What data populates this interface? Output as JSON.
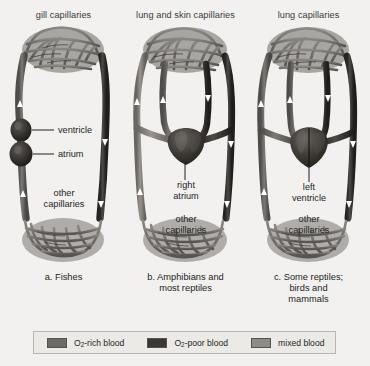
{
  "figure": {
    "background": "#f2f1ef",
    "panels": [
      {
        "id": "panel-a",
        "top_label": "gill capillaries",
        "caption": "a. Fishes",
        "heart_type": "two-chambered",
        "labels": [
          {
            "name": "ventricle",
            "text": "ventricle",
            "style": "leader"
          },
          {
            "name": "atrium",
            "text": "atrium",
            "style": "leader"
          },
          {
            "name": "other-capillaries",
            "text": "other\ncapillaries",
            "style": "inner"
          }
        ]
      },
      {
        "id": "panel-b",
        "top_label": "lung and skin capillaries",
        "caption": "b. Amphibians and\nmost reptiles",
        "heart_type": "three-chambered",
        "labels": [
          {
            "name": "right-atrium",
            "text": "right\natrium",
            "style": "leader-down"
          },
          {
            "name": "other-capillaries",
            "text": "other\ncapillaries",
            "style": "inner"
          }
        ]
      },
      {
        "id": "panel-c",
        "top_label": "lung capillaries",
        "caption": "c. Some reptiles;\nbirds and\nmammals",
        "heart_type": "four-chambered",
        "labels": [
          {
            "name": "left-ventricle",
            "text": "left\nventricle",
            "style": "leader-down"
          },
          {
            "name": "other-capillaries",
            "text": "other\ncapillaries",
            "style": "inner"
          }
        ]
      }
    ]
  },
  "legend": {
    "items": [
      {
        "name": "o2-rich-blood",
        "label_pre": "O",
        "label_sub": "2",
        "label_post": "-rich blood",
        "color": "#6e6a66"
      },
      {
        "name": "o2-poor-blood",
        "label_pre": "O",
        "label_sub": "2",
        "label_post": "-poor blood",
        "color": "#3a3734"
      },
      {
        "name": "mixed-blood",
        "label_pre": "",
        "label_sub": "",
        "label_post": "mixed blood",
        "color": "#8e8a86"
      }
    ]
  },
  "colors": {
    "oxygen_rich": "#6e6a66",
    "oxygen_poor": "#3a3734",
    "mixed": "#8e8a86",
    "arrow": "#ffffff",
    "text": "#231f20",
    "background": "#f2f1ef"
  }
}
